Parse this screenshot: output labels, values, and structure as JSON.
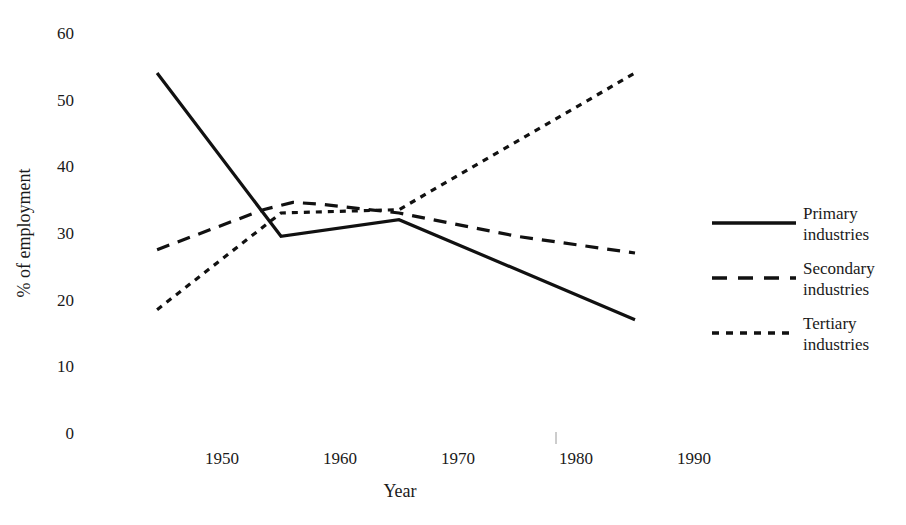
{
  "chart_data": {
    "type": "line",
    "title": "",
    "xlabel": "Year",
    "ylabel": "% of employment",
    "xlim": [
      1940,
      1995
    ],
    "ylim": [
      0,
      60
    ],
    "grid": false,
    "legend_position": "right",
    "x_ticks": [
      "1950",
      "1960",
      "1970",
      "1980",
      "1990"
    ],
    "x_tick_values": [
      1950,
      1960,
      1970,
      1980,
      1990
    ],
    "y_ticks": [
      "0",
      "10",
      "20",
      "30",
      "40",
      "50",
      "60"
    ],
    "y_tick_values": [
      0,
      10,
      20,
      30,
      40,
      50,
      60
    ],
    "series": [
      {
        "name": "Primary industries",
        "legend_line_1": "Primary",
        "legend_line_2": "industries",
        "style": "solid",
        "dash": "none",
        "color": "#111111",
        "x": [
          1944.5,
          1955,
          1965,
          1985
        ],
        "values": [
          54,
          29.5,
          32,
          17
        ]
      },
      {
        "name": "Secondary industries",
        "legend_line_1": "Secondary",
        "legend_line_2": "industries",
        "style": "long-dash",
        "dash": "13,9",
        "color": "#111111",
        "x": [
          1944.5,
          1953.5,
          1956,
          1958.5,
          1965,
          1975,
          1985
        ],
        "values": [
          27.5,
          33.5,
          34.6,
          34.3,
          33,
          29.5,
          27
        ]
      },
      {
        "name": "Tertiary industries",
        "legend_line_1": "Tertiary",
        "legend_line_2": "industries",
        "style": "short-dash",
        "dash": "6,6",
        "color": "#111111",
        "x": [
          1944.5,
          1955,
          1965,
          1985
        ],
        "values": [
          18.5,
          33,
          33.5,
          54
        ]
      }
    ]
  },
  "axes": {
    "y_label": "% of employment",
    "x_label": "Year",
    "y_tick_0": "0",
    "y_tick_10": "10",
    "y_tick_20": "20",
    "y_tick_30": "30",
    "y_tick_40": "40",
    "y_tick_50": "50",
    "y_tick_60": "60",
    "x_tick_1950": "1950",
    "x_tick_1960": "1960",
    "x_tick_1970": "1970",
    "x_tick_1980": "1980",
    "x_tick_1990": "1990"
  },
  "legend": {
    "items": [
      {
        "line1": "Primary",
        "line2": "industries",
        "style": "solid"
      },
      {
        "line1": "Secondary",
        "line2": "industries",
        "style": "long-dash"
      },
      {
        "line1": "Tertiary",
        "line2": "industries",
        "style": "short-dash"
      }
    ]
  }
}
